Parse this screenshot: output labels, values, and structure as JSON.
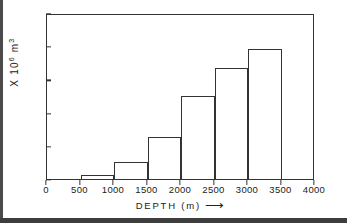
{
  "chart_data": {
    "type": "bar",
    "title": "",
    "subtitle": "",
    "xlabel": "DEPTH  (m)",
    "xlabel_arrow": "⟶",
    "ylabel_prefix": "X 10",
    "ylabel_exp": "6",
    "ylabel_unit": "m",
    "ylabel_unit_exp": "3",
    "ylabel_full": "X 10^6 m^3",
    "xlim": [
      0,
      4000
    ],
    "ylim": [
      0,
      50
    ],
    "xticks": [
      0,
      500,
      1000,
      1500,
      2000,
      2500,
      3000,
      3500,
      4000
    ],
    "xtick_labels": [
      "0",
      "500",
      "1000",
      "1500",
      "2000",
      "2500",
      "3000",
      "3500",
      "4000"
    ],
    "yticks": [
      0,
      10,
      20,
      30,
      40,
      50
    ],
    "ytick_labels": [
      "0",
      "10",
      "20",
      "30",
      "40",
      "50"
    ],
    "grid": false,
    "legend": null,
    "bin_edges": [
      500,
      1000,
      1500,
      2000,
      2500,
      3000,
      3500
    ],
    "categories": [
      "500-1000",
      "1000-1500",
      "1500-2000",
      "2000-2500",
      "2500-3000",
      "3000-3500"
    ],
    "values": [
      1.3,
      5.0,
      12.8,
      25.0,
      33.3,
      39.2
    ],
    "bars": [
      {
        "x0": 500,
        "x1": 1000,
        "value": 1.3
      },
      {
        "x0": 1000,
        "x1": 1500,
        "value": 5.0
      },
      {
        "x0": 1500,
        "x1": 2000,
        "value": 12.8
      },
      {
        "x0": 2000,
        "x1": 2500,
        "value": 25.0
      },
      {
        "x0": 2500,
        "x1": 3000,
        "value": 33.3
      },
      {
        "x0": 3000,
        "x1": 3500,
        "value": 39.2
      }
    ],
    "colors": {
      "bar_edge": "#333333",
      "bar_fill": "transparent",
      "axis": "#333333",
      "text": "#222222",
      "background": "#ffffff"
    }
  }
}
